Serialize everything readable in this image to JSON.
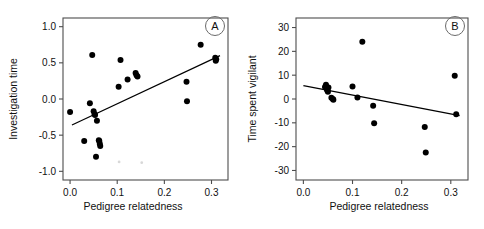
{
  "figure": {
    "width": 484,
    "height": 229,
    "background": "#ffffff",
    "point_color": "#000000",
    "line_color": "#000000",
    "axis_color": "#4d4d4d"
  },
  "chart_data": [
    {
      "type": "scatter",
      "panel_label": "A",
      "title": "",
      "xlabel": "Pedigree relatedness",
      "ylabel": "Investigation time",
      "xlim": [
        -0.015,
        0.335
      ],
      "ylim": [
        -1.12,
        1.12
      ],
      "xticks": [
        0.0,
        0.1,
        0.2,
        0.3
      ],
      "xticklabels": [
        "0.0",
        "0.1",
        "0.2",
        "0.3"
      ],
      "yticks": [
        1.0,
        0.5,
        0.0,
        -0.5,
        -1.0
      ],
      "yticklabels": [
        "1.0",
        "0.5",
        "0.0",
        "-0.5",
        "-1.0"
      ],
      "grid": false,
      "legend": "none",
      "x": [
        0.0,
        0.03,
        0.042,
        0.047,
        0.05,
        0.052,
        0.053,
        0.055,
        0.057,
        0.061,
        0.062,
        0.063,
        0.064,
        0.103,
        0.107,
        0.122,
        0.139,
        0.141,
        0.143,
        0.247,
        0.248,
        0.277,
        0.308,
        0.309,
        0.31
      ],
      "y": [
        -0.18,
        -0.58,
        -0.06,
        0.61,
        -0.17,
        -0.21,
        -0.22,
        -0.8,
        -0.3,
        -0.57,
        -0.58,
        -0.62,
        -0.65,
        0.17,
        0.54,
        0.27,
        0.36,
        0.33,
        0.31,
        0.24,
        -0.03,
        0.75,
        0.57,
        0.53,
        0.55
      ],
      "faint_x": [
        0.104,
        0.152
      ],
      "faint_y": [
        -0.87,
        -0.88
      ],
      "fit_line": {
        "x0": 0.004,
        "y0": -0.36,
        "x1": 0.318,
        "y1": 0.6
      }
    },
    {
      "type": "scatter",
      "panel_label": "B",
      "title": "",
      "xlabel": "Pedigree relatedness",
      "ylabel": "Time spent vigilant",
      "xlim": [
        -0.015,
        0.335
      ],
      "ylim": [
        -34,
        34
      ],
      "xticks": [
        0.0,
        0.1,
        0.2,
        0.3
      ],
      "xticklabels": [
        "0.0",
        "0.1",
        "0.2",
        "0.3"
      ],
      "yticks": [
        30,
        20,
        10,
        0,
        -10,
        -20,
        -30
      ],
      "yticklabels": [
        "30",
        "20",
        "10",
        "0",
        "-10",
        "-20",
        "-30"
      ],
      "grid": false,
      "legend": "none",
      "x": [
        0.044,
        0.046,
        0.047,
        0.048,
        0.049,
        0.05,
        0.051,
        0.057,
        0.06,
        0.061,
        0.1,
        0.11,
        0.12,
        0.142,
        0.144,
        0.247,
        0.249,
        0.308,
        0.311
      ],
      "y": [
        5.0,
        6.0,
        4.5,
        4.0,
        3.5,
        3.0,
        4.8,
        0.5,
        0.0,
        -0.3,
        5.2,
        0.6,
        24.0,
        -2.8,
        -10.2,
        -11.8,
        -22.5,
        9.8,
        -6.4
      ],
      "fit_line": {
        "x0": 0.0,
        "y0": 5.6,
        "x1": 0.318,
        "y1": -7.0
      }
    }
  ]
}
